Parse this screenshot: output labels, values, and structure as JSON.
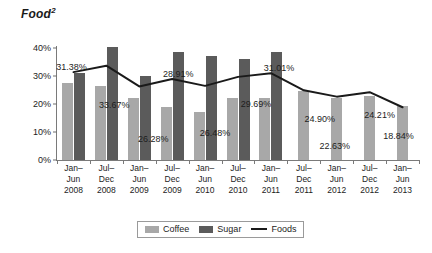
{
  "chart": {
    "title": "Food",
    "title_superscript": "2"
  },
  "legend": {
    "position": "bottom-center",
    "items": [
      {
        "label": "Coffee",
        "type": "bar",
        "color": "#a8a8a8"
      },
      {
        "label": "Sugar",
        "type": "bar",
        "color": "#5b5b5b"
      },
      {
        "label": "Foods",
        "type": "line",
        "color": "#1a1a1a"
      }
    ]
  },
  "chart_data": {
    "type": "bar",
    "title": "Food2",
    "xlabel": "",
    "ylabel": "",
    "ylim": [
      0,
      40
    ],
    "ytick_labels": [
      "0%",
      "10%",
      "20%",
      "30%",
      "40%"
    ],
    "ytick_values": [
      0,
      10,
      20,
      30,
      40
    ],
    "grid": false,
    "categories": [
      "Jan–\nJun\n2008",
      "Jul–\nDec\n2008",
      "Jan–\nJun\n2009",
      "Jul–\nDec\n2009",
      "Jan–\nJun\n2010",
      "Jul–\nDec\n2010",
      "Jan–\nJun\n2011",
      "Jul–\nDec\n2011",
      "Jan–\nJun\n2012",
      "Jul–\nDec\n2012",
      "Jan–\nJun\n2013"
    ],
    "series": [
      {
        "name": "Coffee",
        "type": "bar",
        "color": "#a8a8a8",
        "values": [
          27.5,
          26.5,
          22.0,
          19.0,
          17.0,
          22.0,
          22.0,
          24.5,
          22.2,
          23.0,
          19.2
        ]
      },
      {
        "name": "Sugar",
        "type": "bar",
        "color": "#5b5b5b",
        "values": [
          31.0,
          40.2,
          30.0,
          38.5,
          37.0,
          36.0,
          38.5,
          null,
          null,
          null,
          null
        ]
      },
      {
        "name": "Foods",
        "type": "line",
        "color": "#1a1a1a",
        "values": [
          31.38,
          33.67,
          26.28,
          28.91,
          26.48,
          29.69,
          31.01,
          24.9,
          22.63,
          24.21,
          18.84
        ],
        "data_labels": [
          "31.38%",
          "33.67%",
          "26.28%",
          "28.91%",
          "26.48%",
          "29.69%",
          "31.01%",
          "24.90%",
          "22.63%",
          "24.21%",
          "18.84%"
        ]
      }
    ]
  }
}
